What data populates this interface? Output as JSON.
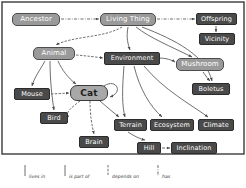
{
  "diagram": {
    "border_color": "#3b3b3b",
    "background": "#ffffff",
    "nodes": [
      {
        "id": "ancestor",
        "label": "Ancestor",
        "kind": "class",
        "x": 12,
        "y": 13,
        "w": 48,
        "h": 13
      },
      {
        "id": "living_thing",
        "label": "Living Thing",
        "kind": "class",
        "x": 100,
        "y": 13,
        "w": 56,
        "h": 13
      },
      {
        "id": "offspring",
        "label": "Offspring",
        "kind": "instance",
        "x": 196,
        "y": 13,
        "w": 41,
        "h": 12
      },
      {
        "id": "vicinity",
        "label": "Vicinity",
        "kind": "instance",
        "x": 199,
        "y": 33,
        "w": 36,
        "h": 12
      },
      {
        "id": "animal",
        "label": "Animal",
        "kind": "class",
        "x": 33,
        "y": 47,
        "w": 42,
        "h": 13
      },
      {
        "id": "environment",
        "label": "Environment",
        "kind": "instance",
        "x": 104,
        "y": 52,
        "w": 56,
        "h": 13
      },
      {
        "id": "mushroom",
        "label": "Mushroom",
        "kind": "class",
        "x": 176,
        "y": 58,
        "w": 48,
        "h": 13
      },
      {
        "id": "boletus",
        "label": "Boletus",
        "kind": "instance",
        "x": 192,
        "y": 83,
        "w": 38,
        "h": 12
      },
      {
        "id": "mouse",
        "label": "Mouse",
        "kind": "instance",
        "x": 14,
        "y": 88,
        "w": 36,
        "h": 12
      },
      {
        "id": "cat",
        "label": "Cat",
        "kind": "focus",
        "x": 70,
        "y": 85,
        "w": 38,
        "h": 16
      },
      {
        "id": "bird",
        "label": "Bird",
        "kind": "instance",
        "x": 40,
        "y": 112,
        "w": 28,
        "h": 12
      },
      {
        "id": "terrain",
        "label": "Terrain",
        "kind": "instance",
        "x": 114,
        "y": 119,
        "w": 33,
        "h": 12
      },
      {
        "id": "ecosystem",
        "label": "Ecosystem",
        "kind": "instance",
        "x": 150,
        "y": 119,
        "w": 44,
        "h": 12
      },
      {
        "id": "climate",
        "label": "Climate",
        "kind": "instance",
        "x": 198,
        "y": 119,
        "w": 36,
        "h": 12
      },
      {
        "id": "brain",
        "label": "Brain",
        "kind": "instance",
        "x": 79,
        "y": 136,
        "w": 30,
        "h": 12
      },
      {
        "id": "hill",
        "label": "Hill",
        "kind": "instance",
        "x": 137,
        "y": 142,
        "w": 24,
        "h": 12
      },
      {
        "id": "inclination",
        "label": "Inclination",
        "kind": "instance",
        "x": 171,
        "y": 142,
        "w": 46,
        "h": 12
      }
    ],
    "edges": [
      {
        "from": "ancestor",
        "to": "living_thing",
        "relation": "has",
        "style": "dash-dot"
      },
      {
        "from": "living_thing",
        "to": "offspring",
        "relation": "has",
        "style": "dash-dot"
      },
      {
        "from": "offspring",
        "to": "vicinity",
        "relation": "is part of",
        "style": "solid"
      },
      {
        "from": "living_thing",
        "to": "animal",
        "relation": "is part of",
        "style": "curve"
      },
      {
        "from": "living_thing",
        "to": "environment",
        "relation": "is part of",
        "style": "curve"
      },
      {
        "from": "living_thing",
        "to": "mushroom",
        "relation": "is part of",
        "style": "curve"
      },
      {
        "from": "living_thing",
        "to": "boletus",
        "relation": "is part of",
        "style": "curve"
      },
      {
        "from": "animal",
        "to": "environment",
        "relation": "depends on",
        "style": "dashed"
      },
      {
        "from": "animal",
        "to": "mouse",
        "relation": "is part of",
        "style": "curve"
      },
      {
        "from": "animal",
        "to": "cat",
        "relation": "is part of",
        "style": "curve"
      },
      {
        "from": "animal",
        "to": "bird",
        "relation": "is part of",
        "style": "curve"
      },
      {
        "from": "mouse",
        "to": "cat",
        "relation": "depends on",
        "style": "dashed"
      },
      {
        "from": "cat",
        "to": "cat",
        "relation": "depends on",
        "style": "self-loop"
      },
      {
        "from": "cat",
        "to": "bird",
        "relation": "depends on",
        "style": "dashed"
      },
      {
        "from": "cat",
        "to": "brain",
        "relation": "depends on",
        "style": "dashed"
      },
      {
        "from": "cat",
        "to": "terrain",
        "relation": "lives in",
        "style": "solid"
      },
      {
        "from": "environment",
        "to": "terrain",
        "relation": "is part of",
        "style": "solid"
      },
      {
        "from": "environment",
        "to": "ecosystem",
        "relation": "is part of",
        "style": "solid"
      },
      {
        "from": "environment",
        "to": "climate",
        "relation": "is part of",
        "style": "solid"
      },
      {
        "from": "environment",
        "to": "mushroom",
        "relation": "lives in",
        "style": "solid"
      },
      {
        "from": "mushroom",
        "to": "boletus",
        "relation": "is part of",
        "style": "solid"
      },
      {
        "from": "terrain",
        "to": "hill",
        "relation": "is part of",
        "style": "solid"
      },
      {
        "from": "hill",
        "to": "inclination",
        "relation": "has",
        "style": "dash-dot"
      }
    ]
  },
  "legend": {
    "items": [
      {
        "label": "lives in",
        "style": "solid"
      },
      {
        "label": "is part of",
        "style": "solid"
      },
      {
        "label": "depends on",
        "style": "dashed"
      },
      {
        "label": "has",
        "style": "dash-dot"
      }
    ]
  }
}
